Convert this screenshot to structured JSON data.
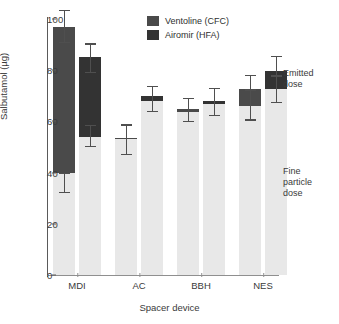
{
  "chart_data": {
    "type": "bar",
    "subtype": "stacked-bar-grouped-with-error-bars",
    "title": "",
    "xlabel": "Spacer device",
    "ylabel": "Salbutamol (µg)",
    "ylim": [
      0,
      100
    ],
    "yticks": [
      0,
      20,
      40,
      60,
      80,
      100
    ],
    "grid": false,
    "categories": [
      "MDI",
      "AC",
      "BBH",
      "NES"
    ],
    "legend": {
      "position": "top-center",
      "entries": [
        {
          "name": "Ventoline (CFC)",
          "color": "#4a4a4a"
        },
        {
          "name": "Airomir (HFA)",
          "color": "#333333"
        }
      ]
    },
    "stack_segments": [
      {
        "name": "Fine particle dose",
        "color": "#e8e8e8"
      },
      {
        "name": "Emitted dose",
        "color": "#434343"
      }
    ],
    "annotations": [
      {
        "name": "emitted-dose",
        "text_lines": [
          "Emitted",
          "dose"
        ]
      },
      {
        "name": "fine-particle-dose",
        "text_lines": [
          "Fine",
          "particle",
          "dose"
        ]
      }
    ],
    "series": [
      {
        "name": "Ventoline (CFC)",
        "color": "#4a4a4a",
        "fine_particle_dose": [
          40.0,
          53.0,
          64.5,
          66.0
        ],
        "fine_particle_err_low": [
          32.0,
          47.0,
          59.8,
          60.3
        ],
        "fine_particle_err_high": [
          40.0,
          58.8,
          69.2,
          72.5
        ],
        "emitted_dose": [
          97.0,
          53.5,
          64.5,
          72.5
        ],
        "emitted_err_low": [
          90.5,
          47.0,
          59.8,
          60.3
        ],
        "emitted_err_high": [
          103.5,
          58.8,
          69.2,
          78.3
        ]
      },
      {
        "name": "Airomir (HFA)",
        "color": "#333333",
        "fine_particle_dose": [
          54.0,
          68.0,
          67.5,
          72.5
        ],
        "fine_particle_err_low": [
          50.0,
          63.5,
          62.0,
          67.3
        ],
        "fine_particle_err_high": [
          58.5,
          74.0,
          73.0,
          78.0
        ],
        "emitted_dose": [
          85.0,
          70.0,
          67.5,
          79.8
        ],
        "emitted_err_low": [
          79.0,
          63.5,
          62.0,
          67.3
        ],
        "emitted_err_high": [
          90.5,
          74.0,
          73.0,
          85.5
        ]
      }
    ],
    "bars": [
      {
        "group": "MDI",
        "series": "Ventoline (CFC)",
        "fine": 40.0,
        "emitted": 97.0,
        "fine_lo": 32.0,
        "fine_hi": 40.0,
        "emit_lo": 90.5,
        "emit_hi": 103.5
      },
      {
        "group": "MDI",
        "series": "Airomir (HFA)",
        "fine": 54.0,
        "emitted": 85.0,
        "fine_lo": 50.0,
        "fine_hi": 58.5,
        "emit_lo": 79.0,
        "emit_hi": 90.5
      },
      {
        "group": "AC",
        "series": "Ventoline (CFC)",
        "fine": 53.0,
        "emitted": 53.5,
        "fine_lo": 47.0,
        "fine_hi": 58.8,
        "emit_lo": 47.0,
        "emit_hi": 58.8
      },
      {
        "group": "AC",
        "series": "Airomir (HFA)",
        "fine": 68.0,
        "emitted": 70.0,
        "fine_lo": 63.5,
        "fine_hi": 74.0,
        "emit_lo": 63.5,
        "emit_hi": 74.0
      },
      {
        "group": "BBH",
        "series": "Ventoline (CFC)",
        "fine": 64.5,
        "emitted": 64.5,
        "fine_lo": 59.8,
        "fine_hi": 69.2,
        "emit_lo": 59.8,
        "emit_hi": 69.2
      },
      {
        "group": "BBH",
        "series": "Airomir (HFA)",
        "fine": 67.5,
        "emitted": 67.5,
        "fine_lo": 62.0,
        "fine_hi": 73.0,
        "emit_lo": 62.0,
        "emit_hi": 73.0
      },
      {
        "group": "NES",
        "series": "Ventoline (CFC)",
        "fine": 66.0,
        "emitted": 72.5,
        "fine_lo": 60.3,
        "fine_hi": 72.5,
        "emit_lo": 60.3,
        "emit_hi": 78.3
      },
      {
        "group": "NES",
        "series": "Airomir (HFA)",
        "fine": 72.5,
        "emitted": 79.8,
        "fine_lo": 67.3,
        "fine_hi": 78.0,
        "emit_lo": 67.3,
        "emit_hi": 85.5
      }
    ]
  },
  "colors": {
    "fine_particle": "#e8e8e8",
    "emitted_ventoline": "#4a4a4a",
    "emitted_airomir": "#333333",
    "axis": "#5a5a5a",
    "error_bar": "#4f4f4f",
    "text": "#3a3a3a"
  },
  "axis": {
    "ytick_labels": [
      "0",
      "20",
      "40",
      "60",
      "80",
      "100"
    ],
    "xtick_labels": [
      "MDI",
      "AC",
      "BBH",
      "NES"
    ],
    "ylabel": "Salbutamol (µg)",
    "xlabel": "Spacer device"
  },
  "legend": {
    "items": [
      {
        "label": "Ventoline (CFC)"
      },
      {
        "label": "Airomir (HFA)"
      }
    ]
  },
  "annotations": {
    "emitted": {
      "line1": "Emitted",
      "line2": "dose"
    },
    "fine": {
      "line1": "Fine",
      "line2": "particle",
      "line3": "dose"
    }
  }
}
